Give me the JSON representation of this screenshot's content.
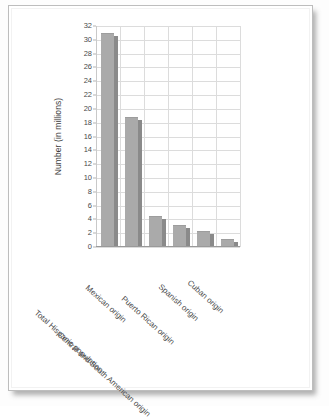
{
  "document": {
    "kind": "scanned-page",
    "background_color": "#ffffff",
    "border_color": "#bdbdbd"
  },
  "chart_data": {
    "type": "bar",
    "title": "",
    "subtitle": "",
    "xlabel": "",
    "ylabel": "Number (in millions)",
    "categories": [
      "Total Hispanic population",
      "Mexican origin",
      "Central and South American origin",
      "Puerto Rican origin",
      "Spanish origin",
      "Cuban origin"
    ],
    "values": [
      31.0,
      18.8,
      4.5,
      3.2,
      2.3,
      1.2
    ],
    "ylim": [
      0,
      32
    ],
    "ytick_step": 2,
    "ytick_labels": [
      "0",
      "2",
      "4",
      "6",
      "8",
      "10",
      "12",
      "14",
      "16",
      "18",
      "20",
      "22",
      "24",
      "26",
      "28",
      "30",
      "32"
    ],
    "grid": true,
    "grid_color": "#dcdcdc",
    "legend": null,
    "legend_position": "none",
    "bar_color": "#aaaaaa",
    "bar_shadow_color": "#8a8a8a",
    "axis_color": "#9a9a9a",
    "text_color": "#4a4a4a",
    "xlabel_rotation_deg": 42
  }
}
